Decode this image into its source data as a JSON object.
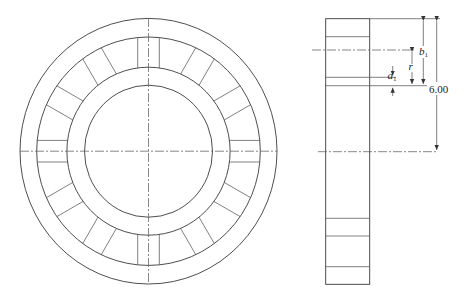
{
  "figure": {
    "type": "engineering drawing",
    "views": [
      "front view (circular bearing ring with blocks)",
      "side view (section)"
    ],
    "colors": {
      "line": "#3a3a3a",
      "background": "#ffffff"
    }
  },
  "front_view": {
    "block_count": 12
  },
  "side_view": {
    "labels": {
      "b1_main": "b",
      "b1_sub": "1",
      "r": "r",
      "a1_main": "a",
      "a1_sub": "1",
      "overall": "6.00"
    }
  }
}
